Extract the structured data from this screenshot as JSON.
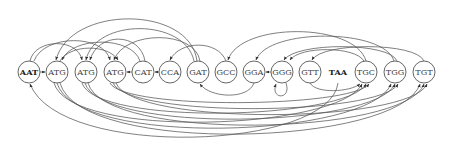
{
  "diagram": {
    "type": "directed-graph",
    "nodes": [
      {
        "id": "n0",
        "label": "AAT",
        "bold": true
      },
      {
        "id": "n1",
        "label": "ATG"
      },
      {
        "id": "n2",
        "label": "ATG"
      },
      {
        "id": "n3",
        "label": "ATG"
      },
      {
        "id": "n4",
        "label": "CAT"
      },
      {
        "id": "n5",
        "label": "CCA"
      },
      {
        "id": "n6",
        "label": "GAT"
      },
      {
        "id": "n7",
        "label": "GCC"
      },
      {
        "id": "n8",
        "label": "GGA"
      },
      {
        "id": "n9",
        "label": "GGG"
      },
      {
        "id": "n10",
        "label": "GTT"
      },
      {
        "id": "n11",
        "label": "TAA",
        "bold": true
      },
      {
        "id": "n12",
        "label": "TGC"
      },
      {
        "id": "n13",
        "label": "TGG"
      },
      {
        "id": "n14",
        "label": "TGT"
      }
    ],
    "edges": [
      {
        "from": "AAT",
        "to": "ATG"
      },
      {
        "from": "CAT",
        "to": "ATG"
      },
      {
        "from": "CCA",
        "to": "CAT"
      },
      {
        "from": "GGG",
        "to": "GGA"
      },
      {
        "from": "GGG",
        "to": "GGG"
      },
      {
        "from": "GGA",
        "to": "GAT"
      },
      {
        "from": "GAT",
        "to": "ATG"
      },
      {
        "from": "GCC",
        "to": "CCA"
      },
      {
        "from": "TGG",
        "to": "GGA"
      },
      {
        "from": "TGG",
        "to": "GGG"
      },
      {
        "from": "TGC",
        "to": "GCC"
      },
      {
        "from": "TGT",
        "to": "GTT"
      },
      {
        "from": "ATG",
        "to": "TGC"
      },
      {
        "from": "ATG",
        "to": "TGG"
      },
      {
        "from": "ATG",
        "to": "TGT"
      },
      {
        "from": "TAA",
        "to": "AAT"
      },
      {
        "from": "GTT",
        "to": "TGT"
      }
    ]
  }
}
